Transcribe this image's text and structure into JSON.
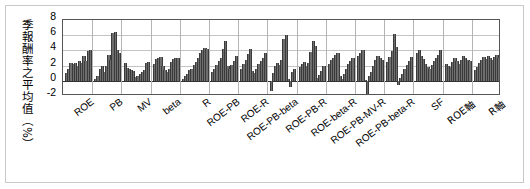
{
  "chart_data": {
    "type": "bar",
    "title": "",
    "xlabel": "",
    "ylabel": "季報酬率之平均值（%）",
    "ylim": [
      -2,
      8
    ],
    "yticks": [
      8,
      6,
      4,
      2,
      0,
      -2
    ],
    "ytick_labels": [
      "8",
      "6",
      "4",
      "2",
      "0",
      "-2"
    ],
    "grid": true,
    "legend": "none",
    "categories": [
      "ROE",
      "PB",
      "MV",
      "beta",
      "R",
      "ROE-PB",
      "ROE-R",
      "ROE-PB-beta",
      "ROE-PB-R",
      "ROE-beta-R",
      "ROE-PB-MV-R",
      "ROE-PB-beta-R",
      "SF",
      "ROE軸",
      "R軸"
    ],
    "group_values": [
      [
        1.0,
        1.6,
        2.4,
        2.2,
        2.4,
        2.0,
        2.6,
        2.3,
        3.3,
        2.6,
        3.9,
        4.0
      ],
      [
        0.3,
        0.6,
        1.5,
        2.0,
        1.2,
        1.9,
        3.4,
        2.7,
        6.3,
        6.4,
        4.0,
        3.7
      ],
      [
        2.4,
        1.7,
        1.6,
        1.4,
        1.3,
        0.5,
        0.6,
        0.9,
        1.1,
        1.4,
        2.3,
        2.5
      ],
      [
        2.2,
        2.9,
        3.0,
        3.1,
        1.9,
        1.4,
        1.2,
        1.6,
        2.5,
        2.9,
        3.0,
        3.0
      ],
      [
        0.2,
        0.6,
        0.9,
        1.4,
        1.5,
        2.1,
        2.5,
        3.0,
        3.6,
        4.1,
        4.3,
        4.2
      ],
      [
        1.1,
        1.6,
        2.1,
        2.6,
        3.0,
        4.2,
        5.3,
        2.0,
        1.5,
        2.1,
        2.6,
        3.2
      ],
      [
        1.5,
        2.2,
        2.8,
        3.5,
        4.2,
        1.3,
        1.0,
        1.5,
        2.2,
        2.6,
        3.0,
        3.6
      ],
      [
        -1.4,
        1.0,
        1.9,
        2.4,
        2.1,
        2.8,
        5.5,
        6.0,
        0.2,
        -0.8,
        1.1,
        1.5
      ],
      [
        1.8,
        2.2,
        2.5,
        2.0,
        2.4,
        3.8,
        5.2,
        4.6,
        0.4,
        0.8,
        1.3,
        1.9
      ],
      [
        2.2,
        2.7,
        3.0,
        3.4,
        3.7,
        0.6,
        0.3,
        0.9,
        1.5,
        2.2,
        2.6,
        3.0
      ],
      [
        3.2,
        3.6,
        4.0,
        0.1,
        -1.8,
        0.6,
        1.2,
        2.0,
        2.7,
        3.3,
        3.0,
        2.8
      ],
      [
        2.5,
        3.1,
        3.9,
        6.2,
        4.5,
        -0.6,
        0.4,
        0.9,
        1.5,
        2.1,
        2.6,
        3.1
      ],
      [
        3.6,
        4.0,
        3.3,
        2.9,
        2.2,
        1.8,
        1.6,
        2.1,
        2.6,
        3.0,
        3.4,
        4.1
      ],
      [
        2.2,
        2.0,
        1.8,
        2.5,
        3.0,
        2.6,
        2.2,
        2.8,
        3.2,
        3.0,
        2.8,
        2.6
      ],
      [
        1.4,
        1.8,
        2.3,
        2.7,
        3.1,
        2.9,
        3.3,
        3.0,
        2.7,
        3.1,
        3.4,
        3.0
      ]
    ]
  }
}
